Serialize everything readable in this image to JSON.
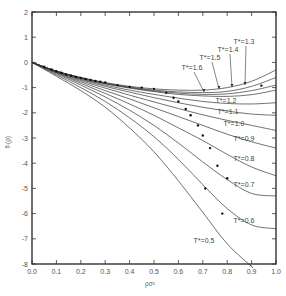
{
  "chart_data": {
    "type": "line",
    "title": "",
    "xlabel": "ρσ³",
    "ylabel": "f¹(ρ)",
    "xlim": [
      0.0,
      1.0
    ],
    "ylim": [
      -8,
      2
    ],
    "grid": false,
    "legend": "inline curve labels",
    "xticks": [
      "0.0",
      "0.1",
      "0.2",
      "0.3",
      "0.4",
      "0.5",
      "0.6",
      "0.7",
      "0.8",
      "0.9",
      "1.0"
    ],
    "yticks": [
      "2",
      "1",
      "0",
      "-1",
      "-2",
      "-3",
      "-4",
      "-5",
      "-6",
      "-7",
      "-8"
    ],
    "x": [
      0.0,
      0.1,
      0.2,
      0.3,
      0.4,
      0.5,
      0.6,
      0.7,
      0.8,
      0.9,
      1.0
    ],
    "series": [
      {
        "name": "T*=1.3",
        "values": [
          0,
          -0.35,
          -0.6,
          -0.8,
          -0.95,
          -1.05,
          -1.1,
          -1.1,
          -1.0,
          -0.75,
          -0.3
        ]
      },
      {
        "name": "T*=1.4",
        "values": [
          0,
          -0.35,
          -0.6,
          -0.82,
          -0.98,
          -1.1,
          -1.17,
          -1.2,
          -1.15,
          -0.95,
          -0.6
        ]
      },
      {
        "name": "T*=1.5",
        "values": [
          0,
          -0.35,
          -0.62,
          -0.84,
          -1.0,
          -1.13,
          -1.22,
          -1.27,
          -1.25,
          -1.12,
          -0.9
        ]
      },
      {
        "name": "T*=1.6",
        "values": [
          0,
          -0.35,
          -0.63,
          -0.85,
          -1.02,
          -1.16,
          -1.27,
          -1.33,
          -1.35,
          -1.28,
          -1.1
        ]
      },
      {
        "name": "T*=1.2",
        "values": [
          0,
          -0.36,
          -0.65,
          -0.9,
          -1.1,
          -1.27,
          -1.42,
          -1.55,
          -1.63,
          -1.65,
          -1.6
        ]
      },
      {
        "name": "T*=1.1",
        "values": [
          0,
          -0.37,
          -0.68,
          -0.95,
          -1.18,
          -1.4,
          -1.6,
          -1.78,
          -1.93,
          -2.05,
          -2.1
        ]
      },
      {
        "name": "T*=1.0",
        "values": [
          0,
          -0.38,
          -0.72,
          -1.02,
          -1.3,
          -1.57,
          -1.83,
          -2.08,
          -2.3,
          -2.5,
          -2.7
        ]
      },
      {
        "name": "T*=0.9",
        "values": [
          0,
          -0.4,
          -0.77,
          -1.12,
          -1.45,
          -1.8,
          -2.15,
          -2.5,
          -2.85,
          -3.15,
          -3.4
        ]
      },
      {
        "name": "T*=0.8",
        "values": [
          0,
          -0.42,
          -0.83,
          -1.23,
          -1.65,
          -2.1,
          -2.6,
          -3.1,
          -3.65,
          -4.15,
          -4.5
        ]
      },
      {
        "name": "T*=0.7",
        "values": [
          0,
          -0.45,
          -0.9,
          -1.37,
          -1.9,
          -2.5,
          -3.2,
          -3.95,
          -4.65,
          -5.2,
          -5.3
        ]
      },
      {
        "name": "T*=0.6",
        "values": [
          0,
          -0.5,
          -1.0,
          -1.55,
          -2.2,
          -2.95,
          -3.85,
          -4.85,
          -5.8,
          -6.45,
          -6.6
        ]
      },
      {
        "name": "T*=0.5",
        "values": [
          0,
          -0.55,
          -1.12,
          -1.78,
          -2.6,
          -3.55,
          -4.7,
          -5.95,
          -7.2,
          -8.1,
          null
        ]
      }
    ],
    "markers_note": "filled dots mark points along curves (simulation data)"
  }
}
